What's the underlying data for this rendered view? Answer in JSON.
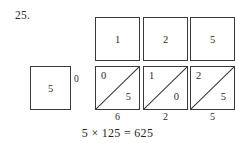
{
  "problem": {
    "number": "25."
  },
  "lattice": {
    "multiplicand_digits": [
      "1",
      "2",
      "5"
    ],
    "multiplier_digits": [
      "5"
    ],
    "carry_label": "0",
    "cells": [
      {
        "upper": "0",
        "lower": "5"
      },
      {
        "upper": "1",
        "lower": "0"
      },
      {
        "upper": "2",
        "lower": "5"
      }
    ],
    "result_digits": [
      "6",
      "2",
      "5"
    ]
  },
  "equation": {
    "text": "5 × 125 = 625"
  },
  "colors": {
    "ink": "#2b2b2b",
    "rule": "#3a3a3a",
    "background": "#ffffff"
  }
}
